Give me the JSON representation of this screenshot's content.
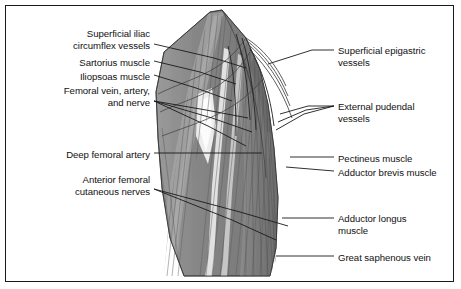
{
  "figure": {
    "background_color": "#ffffff",
    "border_color": "#1a1a1a",
    "text_color": "#111111"
  },
  "illustration": {
    "name": "anterior-thigh-dissection",
    "description": "Grayscale anatomical drawing of the anterior thigh showing muscles, vessels and nerves",
    "tones": {
      "muscle_mid": "#8a8a8a",
      "muscle_dark": "#6f6f6f",
      "muscle_light": "#b4b4b4",
      "vessel_light": "#ededed",
      "striation": "#4a4a4a",
      "outline": "#2b2b2b"
    }
  },
  "labels_left": [
    {
      "id": "superficial-iliac-circumflex-vessels",
      "text": "Superficial iliac\ncircumflex vessels",
      "x": 18,
      "y": 28,
      "width": 132,
      "lines": 2
    },
    {
      "id": "sartorius-muscle",
      "text": "Sartorius muscle",
      "x": 18,
      "y": 57,
      "width": 132,
      "lines": 1
    },
    {
      "id": "iliopsoas-muscle",
      "text": "Iliopsoas muscle",
      "x": 18,
      "y": 71,
      "width": 132,
      "lines": 1
    },
    {
      "id": "femoral-vein-artery-and-nerve",
      "text": "Femoral vein, artery,\nand nerve",
      "x": 18,
      "y": 85,
      "width": 132,
      "lines": 2
    },
    {
      "id": "deep-femoral-artery",
      "text": "Deep femoral artery",
      "x": 18,
      "y": 149,
      "width": 132,
      "lines": 1
    },
    {
      "id": "anterior-femoral-cutaneous-nerves",
      "text": "Anterior femoral\ncutaneous nerves",
      "x": 18,
      "y": 174,
      "width": 132,
      "lines": 2
    }
  ],
  "labels_right": [
    {
      "id": "superficial-epigastric-vessels",
      "text": "Superficial epigastric\nvessels",
      "x": 338,
      "y": 45,
      "width": 112,
      "lines": 2
    },
    {
      "id": "external-pudendal-vessels",
      "text": "External pudendal\nvessels",
      "x": 338,
      "y": 101,
      "width": 112,
      "lines": 2
    },
    {
      "id": "pectineus-muscle",
      "text": "Pectineus muscle",
      "x": 338,
      "y": 153,
      "width": 112,
      "lines": 1
    },
    {
      "id": "adductor-brevis-muscle",
      "text": "Adductor brevis muscle",
      "x": 338,
      "y": 167,
      "width": 118,
      "lines": 1
    },
    {
      "id": "adductor-longus-muscle",
      "text": "Adductor longus\nmuscle",
      "x": 338,
      "y": 213,
      "width": 112,
      "lines": 2
    },
    {
      "id": "great-saphenous-vein",
      "text": "Great saphenous vein",
      "x": 338,
      "y": 252,
      "width": 118,
      "lines": 1
    }
  ],
  "leaders": [
    {
      "id": "leader-superficial-iliac-circumflex-vessels",
      "points": "154,44 214,58 246,68"
    },
    {
      "id": "leader-sartorius-muscle",
      "points": "154,61 200,72 236,84"
    },
    {
      "id": "leader-iliopsoas-muscle",
      "points": "154,75 196,88 232,101"
    },
    {
      "id": "leader-femoral-vein-1",
      "points": "154,101 206,110 248,118"
    },
    {
      "id": "leader-femoral-vein-2",
      "points": "154,101 212,118 252,132"
    },
    {
      "id": "leader-femoral-vein-3",
      "points": "154,101 208,126 246,146"
    },
    {
      "id": "leader-deep-femoral-artery",
      "points": "154,153 262,153"
    },
    {
      "id": "leader-anterior-femoral-cutaneous-1",
      "points": "154,189 240,212 288,226"
    },
    {
      "id": "leader-anterior-femoral-cutaneous-2",
      "points": "154,189 232,220 276,240"
    },
    {
      "id": "leader-superficial-epigastric-vessels",
      "points": "334,50 312,50 268,64"
    },
    {
      "id": "leader-external-pudendal-1",
      "points": "334,106 308,106 280,114"
    },
    {
      "id": "leader-external-pudendal-2",
      "points": "334,106 306,110 278,122"
    },
    {
      "id": "leader-external-pudendal-3",
      "points": "334,106 304,114 276,130"
    },
    {
      "id": "leader-pectineus-muscle",
      "points": "334,157 290,157"
    },
    {
      "id": "leader-adductor-brevis-muscle",
      "points": "334,171 286,167"
    },
    {
      "id": "leader-adductor-longus-muscle",
      "points": "334,218 282,218"
    },
    {
      "id": "leader-great-saphenous-vein",
      "points": "334,256 276,256"
    }
  ]
}
